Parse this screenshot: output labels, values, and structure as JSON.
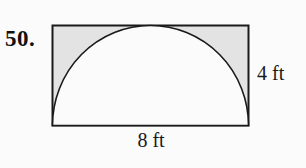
{
  "figure": {
    "problem_number": "50.",
    "type": "geometry-diagram",
    "labels": {
      "height": "4 ft",
      "width": "8 ft"
    },
    "dimensions": {
      "rectangle_width_ft": 8,
      "rectangle_height_ft": 4,
      "semicircle_radius_ft": 4
    },
    "colors": {
      "background": "#fbfbfb",
      "outline": "#1a1a1a",
      "shaded_region": "#e3e3e3",
      "semicircle_fill": "#fbfbfb"
    }
  }
}
